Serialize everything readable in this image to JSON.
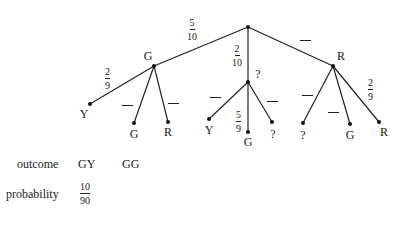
{
  "tree": {
    "root": {
      "x": 248,
      "y": 27
    },
    "level1": [
      {
        "id": "G",
        "label": "G",
        "x": 154,
        "y": 66,
        "edge_prob": {
          "num": "5",
          "den": "10"
        }
      },
      {
        "id": "M",
        "label": "?",
        "x": 248,
        "y": 82,
        "edge_prob": {
          "num": "2",
          "den": "10"
        }
      },
      {
        "id": "R",
        "label": "R",
        "x": 333,
        "y": 66,
        "edge_prob": "blank"
      }
    ],
    "level2": {
      "G": [
        {
          "label": "Y",
          "x": 90,
          "y": 104,
          "edge_prob": {
            "num": "2",
            "den": "9"
          }
        },
        {
          "label": "G",
          "x": 134,
          "y": 123,
          "edge_prob": "blank"
        },
        {
          "label": "R",
          "x": 168,
          "y": 122,
          "edge_prob": "blank"
        }
      ],
      "M": [
        {
          "label": "Y",
          "x": 209,
          "y": 119,
          "edge_prob": "blank"
        },
        {
          "label": "G",
          "x": 248,
          "y": 132,
          "edge_prob": {
            "num": "5",
            "den": "9"
          }
        },
        {
          "label": "?",
          "x": 272,
          "y": 122,
          "edge_prob": "blank"
        }
      ],
      "R": [
        {
          "label": "?",
          "x": 303,
          "y": 123,
          "edge_prob": "blank"
        },
        {
          "label": "G",
          "x": 350,
          "y": 124,
          "edge_prob": "blank"
        },
        {
          "label": "R",
          "x": 379,
          "y": 122,
          "edge_prob": {
            "num": "2",
            "den": "9"
          }
        }
      ]
    }
  },
  "labels": {
    "G1": "G",
    "M1": "?",
    "R1": "R",
    "GY": "Y",
    "GG": "G",
    "GR": "R",
    "MY": "Y",
    "MG": "G",
    "MQ": "?",
    "RQ": "?",
    "RG": "G",
    "RR": "R",
    "p_root_G_num": "5",
    "p_root_G_den": "10",
    "p_root_M_num": "2",
    "p_root_M_den": "10",
    "p_G_Y_num": "2",
    "p_G_Y_den": "9",
    "p_M_G_num": "5",
    "p_M_G_den": "9",
    "p_R_R_num": "2",
    "p_R_R_den": "9"
  },
  "table": {
    "outcome_label": "outcome",
    "probability_label": "probability",
    "outcomes": [
      "GY",
      "GG"
    ],
    "probabilities": [
      {
        "num": "10",
        "den": "90"
      }
    ]
  }
}
